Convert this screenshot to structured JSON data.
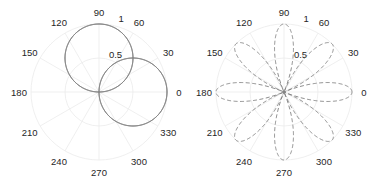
{
  "chart_data": [
    {
      "type": "line",
      "subtype": "polar",
      "title": "",
      "angle_ticks": [
        "0",
        "30",
        "60",
        "90",
        "120",
        "150",
        "180",
        "210",
        "240",
        "270",
        "300",
        "330"
      ],
      "radial_ticks": [
        "0.5",
        "1"
      ],
      "rlim": [
        0,
        1
      ],
      "grid": true,
      "series": [
        {
          "name": "r = sin(theta)",
          "style": "solid",
          "color": "#808080",
          "description": "circle of diameter 1 along 90 deg"
        },
        {
          "name": "r = cos(theta)",
          "style": "solid",
          "color": "#808080",
          "description": "circle of diameter 1 along 0 deg"
        }
      ]
    },
    {
      "type": "line",
      "subtype": "polar",
      "title": "",
      "angle_ticks": [
        "0",
        "30",
        "60",
        "90",
        "120",
        "150",
        "180",
        "210",
        "240",
        "270",
        "300",
        "330"
      ],
      "radial_ticks": [
        "0.5",
        "1"
      ],
      "rlim": [
        0,
        1
      ],
      "grid": true,
      "series": [
        {
          "name": "r = |cos(4 theta)|",
          "style": "dashed",
          "color": "#808080",
          "description": "8-petal rose, petals at 0,45,90,...,315 deg reaching r=1"
        }
      ]
    }
  ],
  "left": {
    "ticks": [
      "0",
      "30",
      "60",
      "90",
      "120",
      "150",
      "180",
      "210",
      "240",
      "270",
      "300",
      "330"
    ],
    "r_labels": [
      "0.5",
      "1"
    ]
  },
  "right": {
    "ticks": [
      "0",
      "30",
      "60",
      "90",
      "120",
      "150",
      "180",
      "210",
      "240",
      "270",
      "300",
      "330"
    ],
    "r_labels": [
      "0.5",
      "1"
    ]
  }
}
